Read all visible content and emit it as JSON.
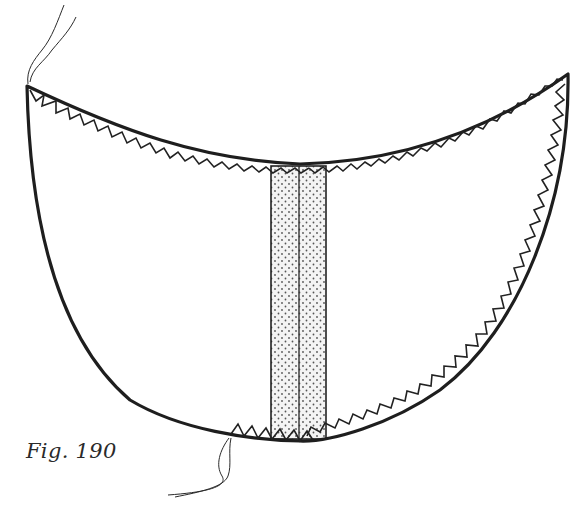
{
  "figure": {
    "caption": "Fig. 190",
    "ink_color": "#1e1e1e",
    "thread_color": "#2a2a2a",
    "panel_fill": "#f3f3f3",
    "dot_color": "#555555"
  },
  "elements": {
    "outline": "curved bowl-shaped fabric piece",
    "top_edge_stitch": "zigzag / catch stitch along top curved edge",
    "right_edge_stitch": "zigzag stitch along right side and lower right curve",
    "bottom_stitch": "short zigzag stitch at bottom center",
    "center_panel": "dotted (stippled) vertical strip split into two halves",
    "threads": [
      "thread tail at top-left corner",
      "thread tail at bottom center"
    ]
  }
}
